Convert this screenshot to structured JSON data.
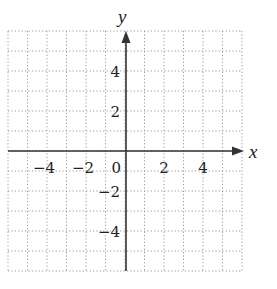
{
  "chart_data": {
    "type": "scatter",
    "title": "",
    "xlabel": "x",
    "ylabel": "y",
    "xlim": [
      -6,
      6
    ],
    "ylim": [
      -6,
      6
    ],
    "grid": true,
    "grid_style": "dotted",
    "grid_step": 1,
    "x_ticks": [
      {
        "value": -4,
        "label": "−4"
      },
      {
        "value": -2,
        "label": "−2"
      },
      {
        "value": 0,
        "label": "0"
      },
      {
        "value": 2,
        "label": "2"
      },
      {
        "value": 4,
        "label": "4"
      }
    ],
    "y_ticks": [
      {
        "value": 4,
        "label": "4"
      },
      {
        "value": 2,
        "label": "2"
      },
      {
        "value": -2,
        "label": "−2"
      },
      {
        "value": -4,
        "label": "−4"
      }
    ],
    "series": []
  },
  "colors": {
    "axis": "#333333",
    "grid": "#9a9a9a",
    "text": "#222222"
  }
}
